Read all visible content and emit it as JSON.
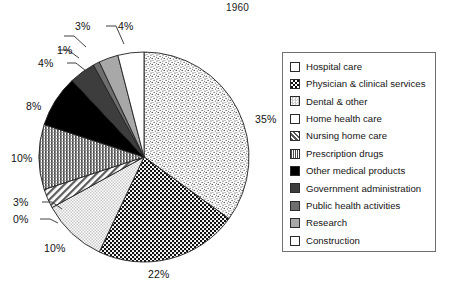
{
  "chart_data": {
    "type": "pie",
    "title": "1960",
    "xlabel": "",
    "ylabel": "",
    "legend_position": "right",
    "grid": false,
    "start_angle_deg": 0,
    "direction": "clockwise",
    "categories": [
      "Hospital care",
      "Physician & clinical services",
      "Dental & other",
      "Home health care",
      "Nursing home care",
      "Prescription drugs",
      "Other medical products",
      "Government administration",
      "Public health activities",
      "Research",
      "Construction"
    ],
    "values": [
      35,
      22,
      10,
      0,
      3,
      10,
      8,
      4,
      1,
      3,
      4
    ],
    "value_labels": [
      "35%",
      "22%",
      "10%",
      "0%",
      "3%",
      "10%",
      "8%",
      "4%",
      "1%",
      "3%",
      "4%"
    ],
    "units": "percent",
    "slices": [
      {
        "label": "Hospital care",
        "value": 35,
        "display": "35%",
        "fill": "fine-speckle",
        "color": "#ffffff"
      },
      {
        "label": "Physician & clinical services",
        "value": 22,
        "display": "22%",
        "fill": "coarse-checker",
        "color": "#ffffff"
      },
      {
        "label": "Dental & other",
        "value": 10,
        "display": "10%",
        "fill": "light-checker",
        "color": "#ffffff"
      },
      {
        "label": "Home health care",
        "value": 0,
        "display": "0%",
        "fill": "solid-white",
        "color": "#ffffff"
      },
      {
        "label": "Nursing home care",
        "value": 3,
        "display": "3%",
        "fill": "diagonal-hatch",
        "color": "#ffffff"
      },
      {
        "label": "Prescription drugs",
        "value": 10,
        "display": "10%",
        "fill": "fine-grid",
        "color": "#ffffff"
      },
      {
        "label": "Other medical products",
        "value": 8,
        "display": "8%",
        "fill": "solid-black",
        "color": "#000000"
      },
      {
        "label": "Government administration",
        "value": 4,
        "display": "4%",
        "fill": "solid-dark-gray",
        "color": "#3d3d3d"
      },
      {
        "label": "Public health activities",
        "value": 1,
        "display": "1%",
        "fill": "solid-medium-gray",
        "color": "#6e6e6e"
      },
      {
        "label": "Research",
        "value": 3,
        "display": "3%",
        "fill": "solid-light-gray",
        "color": "#a8a8a8"
      },
      {
        "label": "Construction",
        "value": 4,
        "display": "4%",
        "fill": "solid-white",
        "color": "#ffffff"
      }
    ]
  },
  "legend": {
    "items": [
      {
        "label": "Hospital care"
      },
      {
        "label": "Physician & clinical services"
      },
      {
        "label": "Dental & other"
      },
      {
        "label": "Home health care"
      },
      {
        "label": "Nursing home care"
      },
      {
        "label": "Prescription drugs"
      },
      {
        "label": "Other medical products"
      },
      {
        "label": "Government administration"
      },
      {
        "label": "Public health activities"
      },
      {
        "label": "Research"
      },
      {
        "label": "Construction"
      }
    ]
  }
}
